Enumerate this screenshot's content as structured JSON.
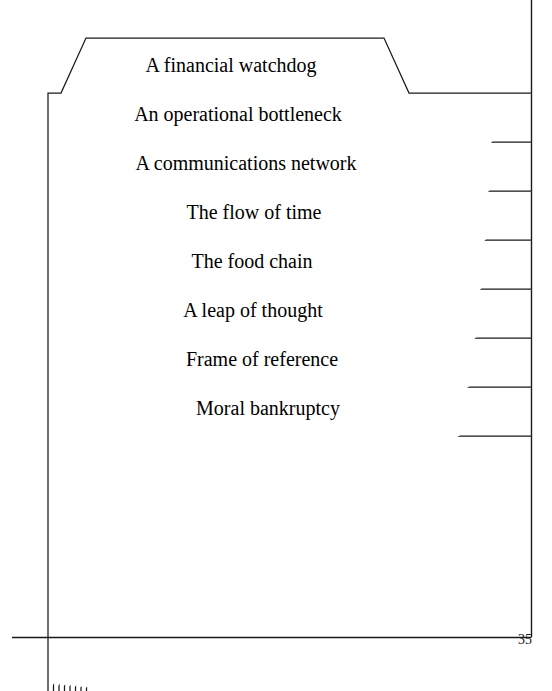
{
  "page": {
    "width": 552,
    "height": 691,
    "background_color": "#ffffff",
    "ink_color": "#1a1a1a",
    "page_number": "35"
  },
  "diagram": {
    "kind": "nested-folder-tabs",
    "tab_count": 8,
    "tabs": [
      {
        "index": 0,
        "label": "A financial watchdog"
      },
      {
        "index": 1,
        "label": "An operational bottleneck"
      },
      {
        "index": 2,
        "label": "A communications network"
      },
      {
        "index": 3,
        "label": "The flow of time"
      },
      {
        "index": 4,
        "label": "The food chain"
      },
      {
        "index": 5,
        "label": "A leap of thought"
      },
      {
        "index": 6,
        "label": "Frame of reference"
      },
      {
        "index": 7,
        "label": "Moral bankruptcy"
      }
    ]
  }
}
